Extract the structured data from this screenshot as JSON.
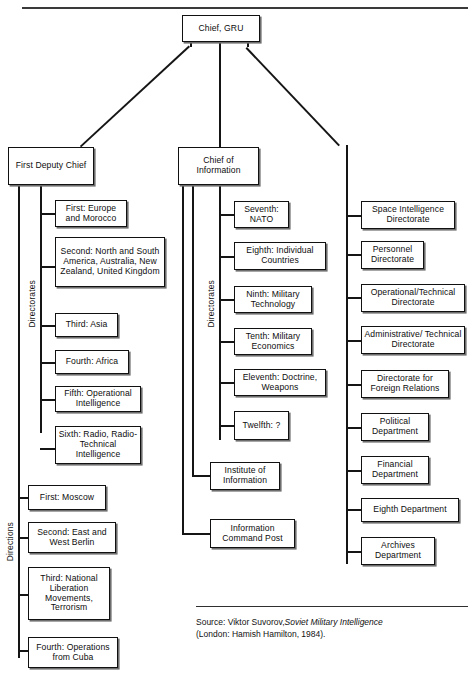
{
  "figure": {
    "title_rule": "",
    "root": {
      "label": "Chief, GRU"
    },
    "branches": [
      {
        "label": "First Deputy Chief"
      },
      {
        "label": "Chief of Information"
      }
    ],
    "bracket_labels": {
      "left_directorates": "Directorates",
      "left_directions": "Directions",
      "mid_directorates": "Directorates"
    },
    "left_directorates": [
      {
        "label": "First: Europe and Morocco"
      },
      {
        "label": "Second: North and South America, Australia, New Zealand, United Kingdom"
      },
      {
        "label": "Third: Asia"
      },
      {
        "label": "Fourth: Africa"
      },
      {
        "label": "Fifth: Operational Intelligence"
      },
      {
        "label": "Sixth: Radio, Radio-Technical Intelligence"
      }
    ],
    "left_directions": [
      {
        "label": "First: Moscow"
      },
      {
        "label": "Second: East and West Berlin"
      },
      {
        "label": "Third: National Liberation Movements, Terrorism"
      },
      {
        "label": "Fourth: Operations from Cuba"
      }
    ],
    "mid_directorates": [
      {
        "label": "Seventh: NATO"
      },
      {
        "label": "Eighth: Individual Countries"
      },
      {
        "label": "Ninth: Military Technology"
      },
      {
        "label": "Tenth: Military Economics"
      },
      {
        "label": "Eleventh: Doctrine, Weapons"
      },
      {
        "label": "Twelfth: ?"
      }
    ],
    "mid_other": [
      {
        "label": "Institute of Information"
      },
      {
        "label": "Information Command Post"
      }
    ],
    "right_units": [
      {
        "label": "Space Intelligence Directorate"
      },
      {
        "label": "Personnel Directorate"
      },
      {
        "label": "Operational/Technical Directorate"
      },
      {
        "label": "Administrative/ Technical Directorate"
      },
      {
        "label": "Directorate for Foreign Relations"
      },
      {
        "label": "Political Department"
      },
      {
        "label": "Financial Department"
      },
      {
        "label": "Eighth Department"
      },
      {
        "label": "Archives Department"
      }
    ],
    "source": {
      "prefix": "Source:",
      "author": "Viktor Suvorov,",
      "work": "Soviet Military Intelligence",
      "publication": "(London: Hamish Hamilton, 1984)."
    },
    "colors": {
      "ink": "#111111",
      "paper": "#ffffff",
      "shadow": "#6e6e6e"
    }
  }
}
